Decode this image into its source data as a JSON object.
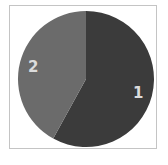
{
  "chart_data": {
    "type": "pie",
    "title": "",
    "categories": [
      "1",
      "2"
    ],
    "values": [
      58,
      42
    ],
    "colors": [
      "#3b3b3b",
      "#6b6b6b"
    ],
    "start_angle_deg": 0,
    "direction": "clockwise",
    "labels_inside": true,
    "legend": "none"
  },
  "labels": {
    "slice1": "1",
    "slice2": "2"
  }
}
